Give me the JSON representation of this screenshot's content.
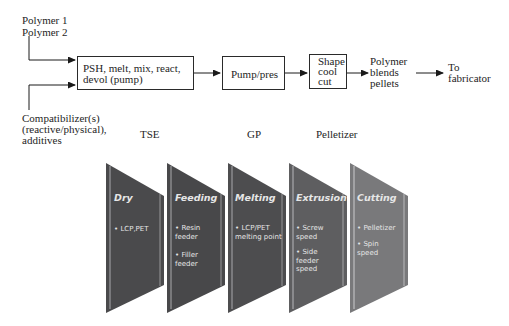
{
  "flow": {
    "inputs": {
      "polymer1": "Polymer 1",
      "polymer2": "Polymer 2",
      "compat_line1": "Compatibilizer(s)",
      "compat_line2": "(reactive/physical),",
      "compat_line3": "additives"
    },
    "boxes": [
      {
        "line1": "PSH, melt, mix, react,",
        "line2": "devol (pump)"
      },
      {
        "line1": "Pump/pres"
      },
      {
        "line1": "Shape",
        "line2": "cool",
        "line3": "cut"
      }
    ],
    "output": {
      "line1": "Polymer",
      "line2": "blends",
      "line3": "pellets"
    },
    "destination": {
      "line1": "To",
      "line2": "fabricator"
    },
    "equipment_labels": [
      "TSE",
      "GP",
      "Pelletizer"
    ]
  },
  "stages": [
    {
      "title": "Dry",
      "items": [
        "LCP,PET"
      ],
      "color": "#4a4a4c"
    },
    {
      "title": "Feeding",
      "items": [
        "Resin feeder",
        "Filler feeder"
      ],
      "color": "#48484a"
    },
    {
      "title": "Melting",
      "items": [
        "LCP/PET melting point"
      ],
      "color": "#4d4d4f"
    },
    {
      "title": "Extrusion",
      "items": [
        "Screw speed",
        "Side feeder speed"
      ],
      "color": "#5e5e60"
    },
    {
      "title": "Cutting",
      "items": [
        "Pelletizer",
        "Spin speed"
      ],
      "color": "#79797b"
    }
  ],
  "bullet": "•"
}
